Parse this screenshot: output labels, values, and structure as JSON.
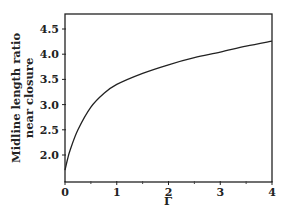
{
  "chart_data": {
    "type": "line",
    "title": "",
    "xlabel": "Γ",
    "ylabel_lines": [
      "Midline length ratio",
      "near closure"
    ],
    "xlim": [
      0,
      4
    ],
    "ylim": [
      1.5,
      4.8
    ],
    "x_ticks": [
      0,
      1,
      2,
      3,
      4
    ],
    "x_minor_ticks": [
      0.5,
      1.5,
      2.5,
      3.5
    ],
    "y_ticks": [
      2.0,
      2.5,
      3.0,
      3.5,
      4.0,
      4.5
    ],
    "x_tick_labels": [
      "0",
      "1",
      "2",
      "3",
      "4"
    ],
    "y_tick_labels": [
      "2.0",
      "2.5",
      "3.0",
      "3.5",
      "4.0",
      "4.5"
    ],
    "grid": false,
    "legend": null,
    "series": [
      {
        "name": "midline length ratio",
        "x": [
          0,
          0.05,
          0.1,
          0.25,
          0.5,
          0.75,
          1.0,
          1.5,
          2.0,
          2.5,
          3.0,
          3.5,
          4.0
        ],
        "y": [
          1.7,
          1.92,
          2.1,
          2.5,
          2.95,
          3.22,
          3.4,
          3.62,
          3.79,
          3.93,
          4.04,
          4.16,
          4.26
        ]
      }
    ]
  }
}
